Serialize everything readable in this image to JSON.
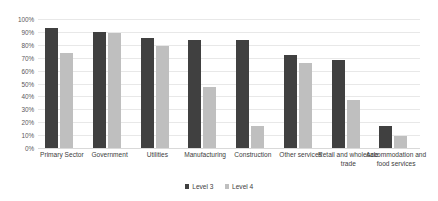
{
  "chart_data": {
    "type": "bar",
    "title": "",
    "xlabel": "",
    "ylabel": "",
    "ylim": [
      0,
      100
    ],
    "y_unit": "%",
    "grid": true,
    "legend_position": "bottom",
    "categories": [
      "Primary Sector",
      "Government",
      "Utilities",
      "Manufacturing",
      "Construction",
      "Other services",
      "Retail and wholesale trade",
      "Accommodation and food services"
    ],
    "y_ticks": [
      "0%",
      "10%",
      "20%",
      "30%",
      "40%",
      "50%",
      "60%",
      "70%",
      "80%",
      "90%",
      "100%"
    ],
    "y_tick_values": [
      0,
      10,
      20,
      30,
      40,
      50,
      60,
      70,
      80,
      90,
      100
    ],
    "series": [
      {
        "name": "Level 3",
        "color": "#404040",
        "values": [
          93,
          90,
          85,
          84,
          84,
          72,
          68,
          17
        ]
      },
      {
        "name": "Level 4",
        "color": "#bfbfbf",
        "values": [
          74,
          89,
          79,
          47,
          17,
          66,
          37,
          9
        ]
      }
    ]
  },
  "legend": {
    "items": [
      {
        "label": "Level 3",
        "swatch": "legend-swatch-level-3"
      },
      {
        "label": "Level 4",
        "swatch": "legend-swatch-level-4"
      }
    ]
  },
  "colors": {
    "level3": "#404040",
    "level4": "#bfbfbf",
    "gridline": "#e8e8e8",
    "background": "#ffffff",
    "axis_text": "#595959",
    "label_text": "#404040"
  }
}
